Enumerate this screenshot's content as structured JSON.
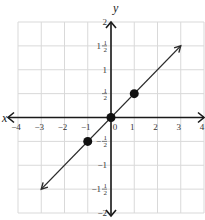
{
  "chart_data": {
    "type": "line",
    "title": "",
    "xlabel": "x",
    "ylabel": "y",
    "xlim": [
      -4,
      4
    ],
    "ylim": [
      -2,
      2
    ],
    "grid": true,
    "x_grid_step": 1,
    "y_grid_step": 0.5,
    "x_ticks": [
      {
        "value": -4,
        "label": "-4"
      },
      {
        "value": -3,
        "label": "-3"
      },
      {
        "value": -2,
        "label": "-2"
      },
      {
        "value": -1,
        "label": "-1"
      },
      {
        "value": 0,
        "label": "0"
      },
      {
        "value": 1,
        "label": "1"
      },
      {
        "value": 2,
        "label": "2"
      },
      {
        "value": 3,
        "label": "3"
      },
      {
        "value": 4,
        "label": "4"
      }
    ],
    "y_ticks": [
      {
        "value": 2,
        "label": "2"
      },
      {
        "value": 1.5,
        "label": "1",
        "frac": "1/2"
      },
      {
        "value": 1,
        "label": "1"
      },
      {
        "value": 0.5,
        "label": "",
        "frac": "1/2"
      },
      {
        "value": -0.5,
        "label": "-",
        "frac": "1/2"
      },
      {
        "value": -1,
        "label": "-1"
      },
      {
        "value": -1.5,
        "label": "-1",
        "frac": "1/2"
      },
      {
        "value": -2,
        "label": "-2"
      }
    ],
    "series": [
      {
        "name": "y = x/2",
        "line_from": [
          -3,
          -1.5
        ],
        "line_to": [
          3,
          1.5
        ],
        "arrows": "both",
        "points": [
          [
            -1,
            -0.5
          ],
          [
            0,
            0
          ],
          [
            1,
            0.5
          ]
        ]
      }
    ],
    "colors": {
      "line": "#2a2a2a",
      "grid": "#d9d9d9",
      "axis": "#1a1a1a"
    }
  }
}
